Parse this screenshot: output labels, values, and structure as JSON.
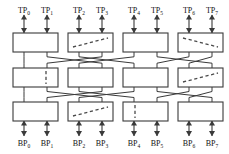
{
  "figure": {
    "name": "three-stage-interconnection-network",
    "width": 229,
    "height": 154,
    "background_color": "#ffffff",
    "line_color": "#3a3a3a",
    "box_fill": "#ffffff",
    "dash_color": "#4a4a4a",
    "label_color": "#111111"
  },
  "top_ports": [
    {
      "id": "TP0",
      "base": "TP",
      "sub": "0",
      "x": 24,
      "label_y": 6
    },
    {
      "id": "TP1",
      "base": "TP",
      "sub": "1",
      "x": 47,
      "label_y": 6
    },
    {
      "id": "TP2",
      "base": "TP",
      "sub": "2",
      "x": 79,
      "label_y": 6
    },
    {
      "id": "TP3",
      "base": "TP",
      "sub": "3",
      "x": 102,
      "label_y": 6
    },
    {
      "id": "TP4",
      "base": "TP",
      "sub": "4",
      "x": 134,
      "label_y": 6
    },
    {
      "id": "TP5",
      "base": "TP",
      "sub": "5",
      "x": 157,
      "label_y": 6
    },
    {
      "id": "TP6",
      "base": "TP",
      "sub": "6",
      "x": 189,
      "label_y": 6
    },
    {
      "id": "TP7",
      "base": "TP",
      "sub": "7",
      "x": 212,
      "label_y": 6
    }
  ],
  "bottom_ports": [
    {
      "id": "BP0",
      "base": "BP",
      "sub": "0",
      "x": 24,
      "label_y": 139
    },
    {
      "id": "BP1",
      "base": "BP",
      "sub": "1",
      "x": 47,
      "label_y": 139
    },
    {
      "id": "BP2",
      "base": "BP",
      "sub": "2",
      "x": 79,
      "label_y": 139
    },
    {
      "id": "BP3",
      "base": "BP",
      "sub": "3",
      "x": 102,
      "label_y": 139
    },
    {
      "id": "BP4",
      "base": "BP",
      "sub": "4",
      "x": 134,
      "label_y": 139
    },
    {
      "id": "BP5",
      "base": "BP",
      "sub": "5",
      "x": 157,
      "label_y": 139
    },
    {
      "id": "BP6",
      "base": "BP",
      "sub": "6",
      "x": 189,
      "label_y": 139
    },
    {
      "id": "BP7",
      "base": "BP",
      "sub": "7",
      "x": 212,
      "label_y": 139
    }
  ],
  "stages": [
    {
      "name": "top-stage",
      "row": 0,
      "box_top": 33,
      "box_height": 19,
      "boxes": [
        {
          "id": "S0-0",
          "x": 13,
          "width": 45,
          "state": "none"
        },
        {
          "id": "S0-1",
          "x": 68,
          "width": 45,
          "state": "diagonal-up"
        },
        {
          "id": "S0-2",
          "x": 123,
          "width": 45,
          "state": "none"
        },
        {
          "id": "S0-3",
          "x": 178,
          "width": 45,
          "state": "diagonal-down"
        }
      ]
    },
    {
      "name": "middle-stage",
      "row": 1,
      "box_top": 68,
      "box_height": 19,
      "boxes": [
        {
          "id": "S1-0",
          "x": 13,
          "width": 45,
          "state": "vertical-right"
        },
        {
          "id": "S1-1",
          "x": 68,
          "width": 45,
          "state": "none"
        },
        {
          "id": "S1-2",
          "x": 123,
          "width": 45,
          "state": "none"
        },
        {
          "id": "S1-3",
          "x": 178,
          "width": 45,
          "state": "diagonal-up"
        }
      ]
    },
    {
      "name": "bottom-stage",
      "row": 2,
      "box_top": 102,
      "box_height": 19,
      "boxes": [
        {
          "id": "S2-0",
          "x": 13,
          "width": 45,
          "state": "none"
        },
        {
          "id": "S2-1",
          "x": 68,
          "width": 45,
          "state": "diagonal-up"
        },
        {
          "id": "S2-2",
          "x": 123,
          "width": 45,
          "state": "vertical-left"
        },
        {
          "id": "S2-3",
          "x": 178,
          "width": 45,
          "state": "none"
        }
      ]
    }
  ],
  "links_upper": [
    {
      "from_x": 24,
      "to_x": 24
    },
    {
      "from_x": 47,
      "to_x": 102
    },
    {
      "from_x": 79,
      "to_x": 134
    },
    {
      "from_x": 102,
      "to_x": 47
    },
    {
      "from_x": 134,
      "to_x": 79
    },
    {
      "from_x": 157,
      "to_x": 212
    },
    {
      "from_x": 189,
      "to_x": 157
    },
    {
      "from_x": 212,
      "to_x": 189
    }
  ],
  "links_lower": [
    {
      "from_x": 24,
      "to_x": 24
    },
    {
      "from_x": 47,
      "to_x": 102
    },
    {
      "from_x": 79,
      "to_x": 134
    },
    {
      "from_x": 102,
      "to_x": 47
    },
    {
      "from_x": 134,
      "to_x": 79
    },
    {
      "from_x": 157,
      "to_x": 212
    },
    {
      "from_x": 189,
      "to_x": 157
    },
    {
      "from_x": 212,
      "to_x": 189
    }
  ]
}
